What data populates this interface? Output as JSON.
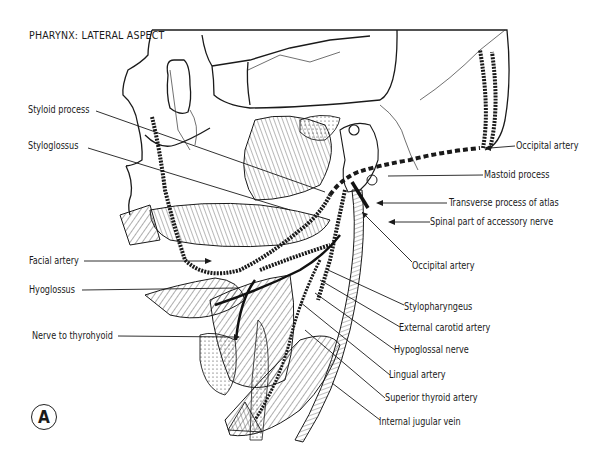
{
  "figure": {
    "title": "PHARYNX: LATERAL ASPECT",
    "panel_marker": "A"
  },
  "labels_left": [
    {
      "id": "styloid-process",
      "text": "Styloid process"
    },
    {
      "id": "styloglossus",
      "text": "Styloglossus"
    },
    {
      "id": "facial-artery",
      "text": "Facial artery"
    },
    {
      "id": "hyoglossus",
      "text": "Hyoglossus"
    },
    {
      "id": "nerve-to-thyrohyoid",
      "text": "Nerve to thyrohyoid"
    }
  ],
  "labels_right": [
    {
      "id": "occipital-artery-upper",
      "text": "Occipital artery"
    },
    {
      "id": "mastoid-process",
      "text": "Mastoid process"
    },
    {
      "id": "transverse-process-of-atlas",
      "text": "Transverse process of atlas"
    },
    {
      "id": "spinal-part-of-accessory-nerve",
      "text": "Spinal part of accessory nerve"
    },
    {
      "id": "occipital-artery-lower",
      "text": "Occipital artery"
    },
    {
      "id": "stylopharyngeus",
      "text": "Stylopharyngeus"
    },
    {
      "id": "external-carotid-artery",
      "text": "External carotid artery"
    },
    {
      "id": "hypoglossal-nerve",
      "text": "Hypoglossal nerve"
    },
    {
      "id": "lingual-artery",
      "text": "Lingual artery"
    },
    {
      "id": "superior-thyroid-artery",
      "text": "Superior thyroid artery"
    },
    {
      "id": "internal-jugular-vein",
      "text": "Internal jugular vein"
    }
  ]
}
